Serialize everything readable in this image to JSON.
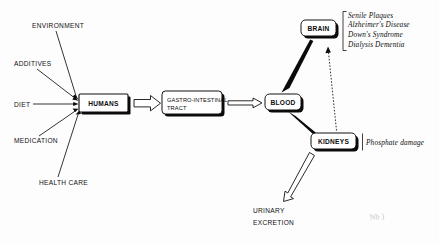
{
  "diagram": {
    "nodes": {
      "humans": "HUMANS",
      "gi_tract_line1": "GASTRO-INTESTINAL",
      "gi_tract_line2": "TRACT",
      "blood": "BLOOD",
      "brain": "BRAIN",
      "kidneys": "KIDNEYS"
    },
    "inputs": [
      {
        "label": "ENVIRONMENT"
      },
      {
        "label": "ADDITIVES"
      },
      {
        "label": "DIET"
      },
      {
        "label": "MEDICATION"
      },
      {
        "label": "HEALTH CARE"
      }
    ],
    "outputs": {
      "urinary_line1": "URINARY",
      "urinary_line2": "EXCRETION"
    },
    "brain_effects": [
      "Senile  Plaques",
      "Alzheimer's  Disease",
      "Down's  Syndrome",
      "Dialysis  Dementia"
    ],
    "kidney_effect": "Phosphate damage",
    "annotation_marginalia": "Nb )",
    "colors": {
      "ink": "#111111",
      "shadow": "#0a0a0a",
      "paper": "#fdfdfd",
      "faint": "#c9c9c9"
    }
  }
}
